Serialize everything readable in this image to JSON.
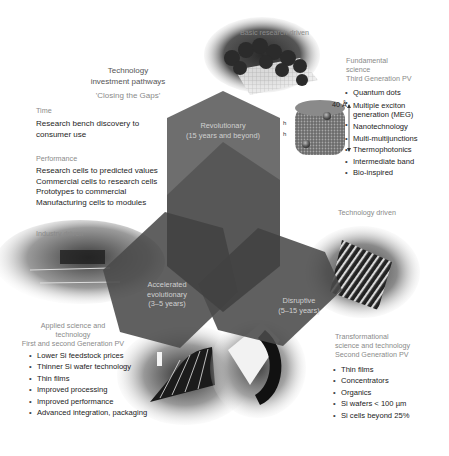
{
  "title_block": {
    "title_line1": "Technology",
    "title_line2": "investment pathways",
    "subtitle": "'Closing the Gaps'"
  },
  "time_section": {
    "heading": "Time",
    "text_line1": "Research bench discovery to",
    "text_line2": "consumer use"
  },
  "performance_section": {
    "heading": "Performance",
    "lines": [
      "Research cells to predicted values",
      "Commercial cells to research cells",
      "Prototypes to commercial",
      "Manufacturing cells to modules"
    ]
  },
  "drivers": {
    "basic_research": "Basic research driven",
    "technology": "Technology driven",
    "industry": "Industry driven"
  },
  "third_gen": {
    "heading_line1": "Fundamental",
    "heading_line2": "science",
    "heading_line3": "Third Generation PV",
    "items": [
      "Quantum dots",
      "Multiple exciton",
      "generation (MEG)",
      "Nanotechnology",
      "Multi-multijunctions",
      "Thermophotonics",
      "Intermediate band",
      "Bio-inspired"
    ],
    "scale_label": "40 Å"
  },
  "first_second_gen": {
    "heading_line1": "Applied science and",
    "heading_line2": "technology",
    "heading_line3": "First and second Generation PV",
    "items": [
      "Lower Si feedstock prices",
      "Thinner Si wafer technology",
      "Thin films",
      "Improved processing",
      "Improved performance",
      "Advanced integration, packaging"
    ]
  },
  "second_gen": {
    "heading_line1": "Transformational",
    "heading_line2": "science and technology",
    "heading_line3": "Second Generation PV",
    "items": [
      "Thin films",
      "Concentrators",
      "Organics",
      "Si wafers < 100 µm",
      "Si cells beyond 25%"
    ]
  },
  "pathways": {
    "revolutionary": {
      "label": "Revolutionary",
      "duration": "(15 years and beyond)"
    },
    "accelerated": {
      "label_line1": "Accelerated",
      "label_line2": "evolutionary",
      "duration": "(3–5 years)"
    },
    "disruptive": {
      "label": "Disruptive",
      "duration": "(5–15 years)"
    }
  },
  "colors": {
    "hex_fill": "#4a4a4a",
    "hex_overlap": "#333333",
    "hex_label": "#d0d0d0",
    "background": "#ffffff"
  }
}
